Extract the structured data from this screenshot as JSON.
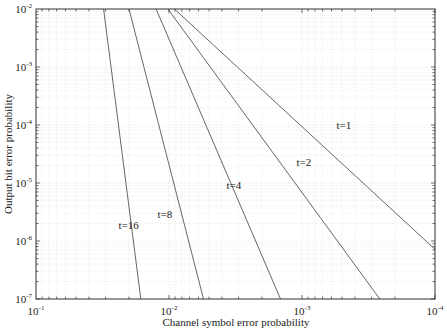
{
  "chart_data": {
    "type": "line",
    "title": "",
    "xlabel": "Channel symbol error probability",
    "ylabel": "Output bit error probability",
    "xscale": "log",
    "yscale": "log",
    "xlim": [
      0.1,
      0.0001
    ],
    "ylim": [
      1e-07,
      0.01
    ],
    "x_reversed": true,
    "grid": true,
    "x_ticks": [
      {
        "value": 0.1,
        "base": "10",
        "exp": "-1"
      },
      {
        "value": 0.01,
        "base": "10",
        "exp": "-2"
      },
      {
        "value": 0.001,
        "base": "10",
        "exp": "-3"
      },
      {
        "value": 0.0001,
        "base": "10",
        "exp": "-4"
      }
    ],
    "y_ticks": [
      {
        "value": 0.01,
        "base": "10",
        "exp": "-2"
      },
      {
        "value": 0.001,
        "base": "10",
        "exp": "-3"
      },
      {
        "value": 0.0001,
        "base": "10",
        "exp": "-4"
      },
      {
        "value": 1e-05,
        "base": "10",
        "exp": "-5"
      },
      {
        "value": 1e-06,
        "base": "10",
        "exp": "-6"
      },
      {
        "value": 1e-07,
        "base": "10",
        "exp": "-7"
      }
    ],
    "series": [
      {
        "name": "t=1",
        "label": "t=1",
        "x": [
          0.0091,
          0.0001
        ],
        "y": [
          0.01,
          7.2e-07
        ],
        "label_at": [
          0.00055,
          8.5e-05
        ]
      },
      {
        "name": "t=2",
        "label": "t=2",
        "x": [
          0.0102,
          0.00026
        ],
        "y": [
          0.01,
          1e-07
        ],
        "label_at": [
          0.0011,
          2e-05
        ]
      },
      {
        "name": "t=4",
        "label": "t=4",
        "x": [
          0.0125,
          0.00145
        ],
        "y": [
          0.01,
          1e-07
        ],
        "label_at": [
          0.0037,
          8e-06
        ]
      },
      {
        "name": "t=8",
        "label": "t=8",
        "x": [
          0.02,
          0.0055
        ],
        "y": [
          0.01,
          1e-07
        ],
        "label_at": [
          0.0122,
          2.5e-06
        ]
      },
      {
        "name": "t=16",
        "label": "t=16",
        "x": [
          0.031,
          0.0163
        ],
        "y": [
          0.01,
          1e-07
        ],
        "label_at": [
          0.024,
          1.6e-06
        ]
      }
    ],
    "colors": {
      "line": "#555555",
      "axis": "#333333",
      "grid": "#e4e4e4",
      "text": "#222222"
    }
  }
}
